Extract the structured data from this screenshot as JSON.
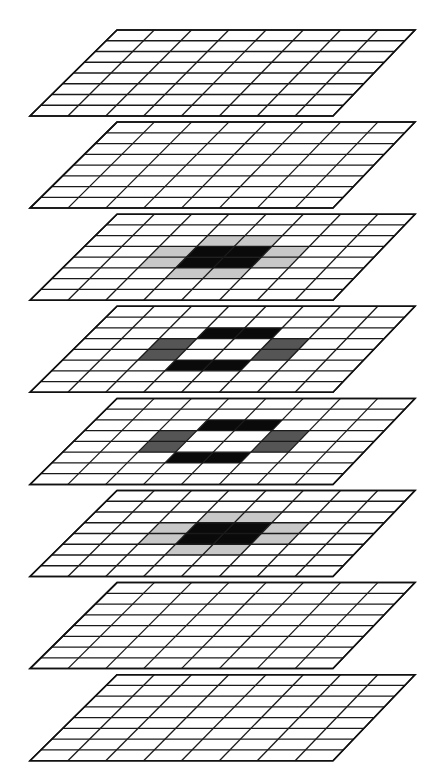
{
  "diagram": {
    "type": "stacked-grid-planes",
    "plane_count": 8,
    "grid": {
      "rows": 8,
      "cols": 8
    },
    "geometry": {
      "first_top_y": 30,
      "plane_spacing": 92.1,
      "plane_height": 86,
      "top_left_x": 117,
      "top_width": 298,
      "skew": 87,
      "bottom_width": 303
    },
    "colors": {
      "background": "#ffffff",
      "line": "#1a1a1a",
      "white": "#ffffff",
      "light_gray": "#c8c8c8",
      "dark_gray": "#555555",
      "black": "#0a0a0a"
    },
    "planes": [
      {
        "index": 0,
        "label": "plane-1",
        "cells": []
      },
      {
        "index": 1,
        "label": "plane-2",
        "cells": []
      },
      {
        "index": 2,
        "label": "plane-3",
        "cells": [
          {
            "r": 2,
            "c": 3,
            "fill": "light_gray"
          },
          {
            "r": 2,
            "c": 4,
            "fill": "light_gray"
          },
          {
            "r": 3,
            "c": 2,
            "fill": "light_gray"
          },
          {
            "r": 3,
            "c": 3,
            "fill": "black"
          },
          {
            "r": 3,
            "c": 4,
            "fill": "black"
          },
          {
            "r": 3,
            "c": 5,
            "fill": "light_gray"
          },
          {
            "r": 4,
            "c": 2,
            "fill": "light_gray"
          },
          {
            "r": 4,
            "c": 3,
            "fill": "black"
          },
          {
            "r": 4,
            "c": 4,
            "fill": "black"
          },
          {
            "r": 4,
            "c": 5,
            "fill": "light_gray"
          },
          {
            "r": 5,
            "c": 3,
            "fill": "light_gray"
          },
          {
            "r": 5,
            "c": 4,
            "fill": "light_gray"
          }
        ]
      },
      {
        "index": 3,
        "label": "plane-4",
        "cells": [
          {
            "r": 2,
            "c": 3,
            "fill": "black"
          },
          {
            "r": 2,
            "c": 4,
            "fill": "black"
          },
          {
            "r": 3,
            "c": 2,
            "fill": "dark_gray"
          },
          {
            "r": 3,
            "c": 5,
            "fill": "dark_gray"
          },
          {
            "r": 4,
            "c": 2,
            "fill": "dark_gray"
          },
          {
            "r": 4,
            "c": 5,
            "fill": "dark_gray"
          },
          {
            "r": 5,
            "c": 3,
            "fill": "black"
          },
          {
            "r": 5,
            "c": 4,
            "fill": "black"
          }
        ]
      },
      {
        "index": 4,
        "label": "plane-5",
        "cells": [
          {
            "r": 2,
            "c": 3,
            "fill": "black"
          },
          {
            "r": 2,
            "c": 4,
            "fill": "black"
          },
          {
            "r": 3,
            "c": 2,
            "fill": "dark_gray"
          },
          {
            "r": 3,
            "c": 5,
            "fill": "dark_gray"
          },
          {
            "r": 4,
            "c": 2,
            "fill": "dark_gray"
          },
          {
            "r": 4,
            "c": 5,
            "fill": "dark_gray"
          },
          {
            "r": 5,
            "c": 3,
            "fill": "black"
          },
          {
            "r": 5,
            "c": 4,
            "fill": "black"
          }
        ]
      },
      {
        "index": 5,
        "label": "plane-6",
        "cells": [
          {
            "r": 2,
            "c": 3,
            "fill": "light_gray"
          },
          {
            "r": 2,
            "c": 4,
            "fill": "light_gray"
          },
          {
            "r": 3,
            "c": 2,
            "fill": "light_gray"
          },
          {
            "r": 3,
            "c": 3,
            "fill": "black"
          },
          {
            "r": 3,
            "c": 4,
            "fill": "black"
          },
          {
            "r": 3,
            "c": 5,
            "fill": "light_gray"
          },
          {
            "r": 4,
            "c": 2,
            "fill": "light_gray"
          },
          {
            "r": 4,
            "c": 3,
            "fill": "black"
          },
          {
            "r": 4,
            "c": 4,
            "fill": "black"
          },
          {
            "r": 4,
            "c": 5,
            "fill": "light_gray"
          },
          {
            "r": 5,
            "c": 3,
            "fill": "light_gray"
          },
          {
            "r": 5,
            "c": 4,
            "fill": "light_gray"
          }
        ]
      },
      {
        "index": 6,
        "label": "plane-7",
        "cells": []
      },
      {
        "index": 7,
        "label": "plane-8",
        "cells": []
      }
    ]
  }
}
